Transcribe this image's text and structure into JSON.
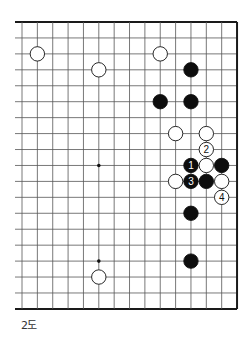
{
  "diagram": {
    "caption": "2도",
    "board": {
      "columns": 15,
      "rows": 19,
      "x0": 22,
      "y0": 22,
      "dx": 15.36,
      "dy": 15.94,
      "left_stub_x": 15,
      "line_color": "#555555",
      "edge_color": "#1a1a1a",
      "edges_thick": [
        "top",
        "right",
        "bottom"
      ],
      "star_points": [
        {
          "col": 5,
          "row": 9
        },
        {
          "col": 5,
          "row": 15
        }
      ]
    },
    "stones": [
      {
        "color": "white",
        "col": 1,
        "row": 2
      },
      {
        "color": "white",
        "col": 5,
        "row": 3
      },
      {
        "color": "white",
        "col": 9,
        "row": 2
      },
      {
        "color": "black",
        "col": 11,
        "row": 3
      },
      {
        "color": "black",
        "col": 9,
        "row": 5
      },
      {
        "color": "black",
        "col": 11,
        "row": 5
      },
      {
        "color": "white",
        "col": 10,
        "row": 7
      },
      {
        "color": "white",
        "col": 12,
        "row": 7
      },
      {
        "color": "white",
        "col": 12,
        "row": 8,
        "label": "2"
      },
      {
        "color": "black",
        "col": 11,
        "row": 9,
        "label": "1"
      },
      {
        "color": "white",
        "col": 12,
        "row": 9
      },
      {
        "color": "black",
        "col": 13,
        "row": 9
      },
      {
        "color": "white",
        "col": 10,
        "row": 10
      },
      {
        "color": "black",
        "col": 11,
        "row": 10,
        "label": "3"
      },
      {
        "color": "black",
        "col": 12,
        "row": 10
      },
      {
        "color": "white",
        "col": 13,
        "row": 10
      },
      {
        "color": "white",
        "col": 13,
        "row": 11,
        "label": "4"
      },
      {
        "color": "black",
        "col": 11,
        "row": 12
      },
      {
        "color": "black",
        "col": 11,
        "row": 15
      },
      {
        "color": "white",
        "col": 5,
        "row": 16
      }
    ]
  }
}
